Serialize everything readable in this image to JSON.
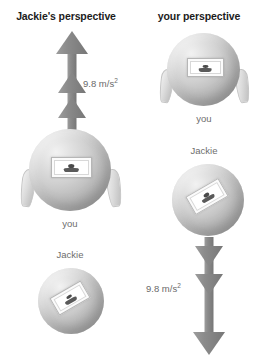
{
  "figure": {
    "type": "physics-diagram",
    "background_color": "#ffffff"
  },
  "columns": [
    {
      "id": "left",
      "title": "Jackie's perspective",
      "arrow": {
        "direction": "up",
        "label": "9.8 m/s",
        "label_exponent": "2",
        "color": "#8a8a8a",
        "chevrons": 3
      },
      "objects": [
        {
          "id": "you",
          "label": "you",
          "kind": "rocket",
          "has_fins": true,
          "window_rotation_deg": 0
        },
        {
          "id": "jackie",
          "label": "Jackie",
          "kind": "sphere",
          "has_fins": false,
          "window_rotation_deg": -30
        }
      ]
    },
    {
      "id": "right",
      "title": "your perspective",
      "arrow": {
        "direction": "down",
        "label": "9.8 m/s",
        "label_exponent": "2",
        "color": "#8a8a8a",
        "chevrons": 3
      },
      "objects": [
        {
          "id": "you",
          "label": "you",
          "kind": "rocket",
          "has_fins": true,
          "window_rotation_deg": 0
        },
        {
          "id": "jackie",
          "label": "Jackie",
          "kind": "sphere",
          "has_fins": false,
          "window_rotation_deg": -30
        }
      ]
    }
  ],
  "colors": {
    "title_text": "#1c1c1c",
    "caption_text": "#6d6d6d",
    "arrow_gray": "#8a8a8a",
    "sphere_light": "#f2f2f2",
    "sphere_dark": "#949494"
  }
}
